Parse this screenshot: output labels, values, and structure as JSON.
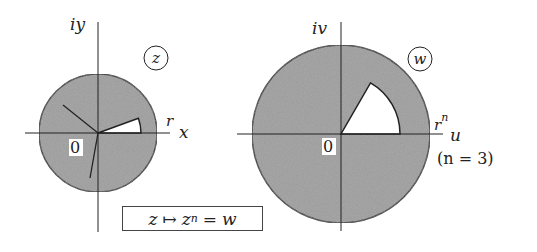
{
  "colors": {
    "disk_fill": "#9a9a9a",
    "stroke": "#222222",
    "wedge_fill": "#ffffff"
  },
  "z_plane": {
    "tag": "z",
    "imag_axis_label": "iy",
    "real_axis_label": "x",
    "radius_label": "r",
    "origin_label": "0",
    "wedge_angle_deg": 20
  },
  "w_plane": {
    "tag": "w",
    "imag_axis_label": "iv",
    "real_axis_label": "u",
    "radius_label": "r",
    "radius_exponent": "n",
    "origin_label": "0",
    "note": "(n = 3)",
    "wedge_angle_deg": 60
  },
  "formula": {
    "lhs": "z",
    "maps_to": "↦",
    "base": "z",
    "exponent": "n",
    "equals": "=",
    "rhs": "w"
  }
}
